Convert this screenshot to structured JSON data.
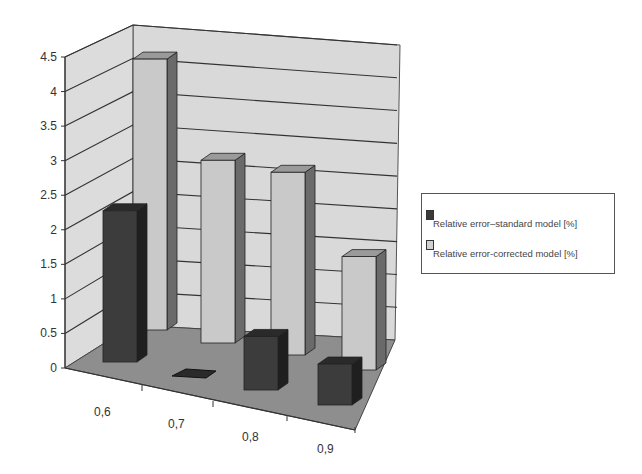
{
  "chart_data": {
    "type": "bar",
    "subtype": "3d-clustered-column",
    "title": "",
    "xlabel": "",
    "ylabel": "",
    "categories": [
      "0,6",
      "0,7",
      "0,8",
      "0,9"
    ],
    "series": [
      {
        "name": "Relative error–standard model [%]",
        "values": [
          2.4,
          0.05,
          0.85,
          0.65
        ],
        "color": "#3a3a3a"
      },
      {
        "name": "Relative error-corrected model [%]",
        "values": [
          4.3,
          2.9,
          2.9,
          1.8
        ],
        "color": "#c4c4c4"
      }
    ],
    "yticks": [
      "0",
      "0.5",
      "1",
      "1.5",
      "2",
      "2.5",
      "3",
      "3.5",
      "4",
      "4.5"
    ],
    "ylim": [
      0,
      4.5
    ],
    "grid": true,
    "legend_position": "right"
  },
  "legend": {
    "items": [
      {
        "label": "Relative error–standard model [%]",
        "color": "#3a3a3a"
      },
      {
        "label": "Relative error-corrected model [%]",
        "color": "#c4c4c4"
      }
    ]
  }
}
